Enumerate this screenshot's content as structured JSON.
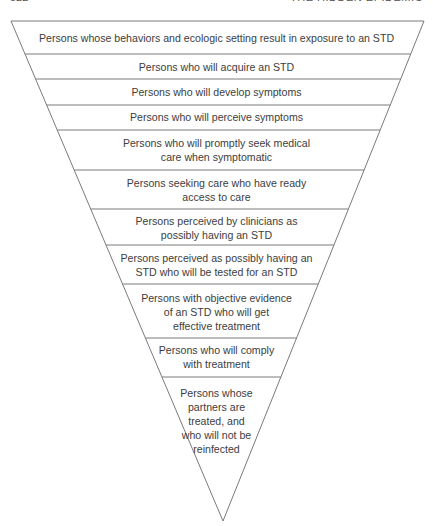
{
  "page_header": {
    "page_number": "522",
    "running_title": "THE HIDDEN EPIDEMIC"
  },
  "diagram": {
    "type": "inverted-funnel",
    "stroke_color": "#7a7a7a",
    "fill_color": "#ffffff",
    "text_color": "#3d3d3d",
    "bands": [
      {
        "label": "Persons whose behaviors and ecologic setting result in exposure to an STD"
      },
      {
        "label": "Persons who will acquire an STD"
      },
      {
        "label": "Persons who will develop symptoms"
      },
      {
        "label": "Persons who will perceive symptoms"
      },
      {
        "label": "Persons who will promptly seek medical\ncare when symptomatic"
      },
      {
        "label": "Persons seeking care who have ready\naccess to care"
      },
      {
        "label": "Persons perceived by clinicians as\npossibly having an STD"
      },
      {
        "label": "Persons perceived as possibly having an\nSTD who will be tested for an STD"
      },
      {
        "label": "Persons with objective evidence\nof an STD who will get\neffective treatment"
      },
      {
        "label": "Persons who will comply\nwith treatment"
      },
      {
        "label": "Persons whose\npartners are\ntreated, and\nwho will not be\nreinfected"
      }
    ]
  }
}
